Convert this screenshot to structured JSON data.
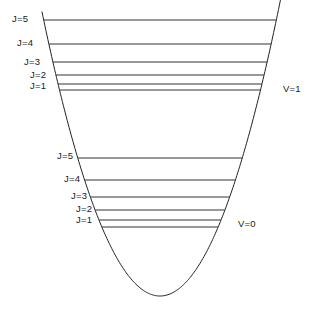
{
  "figure": {
    "type": "rovibrational-energy-level-diagram",
    "background_color": "#ffffff",
    "line_color": "#333333",
    "curve_color": "#222222",
    "text_color": "#1a1a1a",
    "width": 319,
    "height": 309
  },
  "chart_data": {
    "type": "line",
    "title": "",
    "subtitle": "",
    "xlabel": "",
    "ylabel": "",
    "grid": false,
    "legend_position": "none",
    "axis_ranges": {
      "x_pixels": [
        42,
        294
      ],
      "y_pixels": [
        12,
        296
      ]
    },
    "potential_curve": {
      "shape": "parabola",
      "vertex_x": 160,
      "vertex_y": 296,
      "curvature_k": 0.0204,
      "left_top_x": 42,
      "right_top_x": 294,
      "top_y": 12
    },
    "series": [
      {
        "name": "V=1",
        "vibrational_quantum_number": 1,
        "base_level_y": 90,
        "rotational_levels": [
          {
            "J": 1,
            "label": "J=1",
            "y": 84
          },
          {
            "J": 2,
            "label": "J=2",
            "y": 75
          },
          {
            "J": 3,
            "label": "J=3",
            "y": 62
          },
          {
            "J": 4,
            "label": "J=4",
            "y": 44
          },
          {
            "J": 5,
            "label": "J=5",
            "y": 20
          }
        ]
      },
      {
        "name": "V=0",
        "vibrational_quantum_number": 0,
        "base_level_y": 227,
        "rotational_levels": [
          {
            "J": 1,
            "label": "J=1",
            "y": 220
          },
          {
            "J": 2,
            "label": "J=2",
            "y": 210
          },
          {
            "J": 3,
            "label": "J=3",
            "y": 197
          },
          {
            "J": 4,
            "label": "J=4",
            "y": 180
          },
          {
            "J": 5,
            "label": "J=5",
            "y": 158
          }
        ]
      }
    ]
  },
  "labels": {
    "upper_group": {
      "vibrational": {
        "text": "V=1",
        "x": 283,
        "y": 84
      },
      "rotational": [
        {
          "text": "J=5",
          "x": 12,
          "y": 14
        },
        {
          "text": "J=4",
          "x": 17,
          "y": 38
        },
        {
          "text": "J=3",
          "x": 24,
          "y": 57
        },
        {
          "text": "J=2",
          "x": 30,
          "y": 70
        },
        {
          "text": "J=1",
          "x": 30,
          "y": 81
        }
      ]
    },
    "lower_group": {
      "vibrational": {
        "text": "V=0",
        "x": 238,
        "y": 219
      },
      "rotational": [
        {
          "text": "J=5",
          "x": 57,
          "y": 151
        },
        {
          "text": "J=4",
          "x": 64,
          "y": 174
        },
        {
          "text": "J=3",
          "x": 71,
          "y": 191
        },
        {
          "text": "J=2",
          "x": 76,
          "y": 204
        },
        {
          "text": "J=1",
          "x": 76,
          "y": 215
        }
      ]
    }
  }
}
